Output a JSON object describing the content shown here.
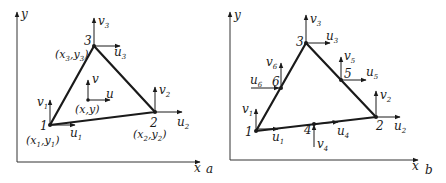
{
  "panels": [
    {
      "id": "a",
      "panel_label": "a",
      "axes": {
        "x": "x",
        "y": "y"
      },
      "nodes": [
        {
          "id": "1",
          "label": "1",
          "coord": "(x1,y1)",
          "u": "u1",
          "v": "v1"
        },
        {
          "id": "2",
          "label": "2",
          "coord": "(x2,y2)",
          "u": "u2",
          "v": "v2"
        },
        {
          "id": "3",
          "label": "3",
          "coord": "(x3,y3)",
          "u": "u3",
          "v": "v3"
        }
      ],
      "interior_point": {
        "coord": "(x,y)",
        "u": "u",
        "v": "v"
      }
    },
    {
      "id": "b",
      "panel_label": "b",
      "axes": {
        "x": "x",
        "y": "y"
      },
      "nodes": [
        {
          "id": "1",
          "label": "1",
          "u": "u1",
          "v": "v1"
        },
        {
          "id": "2",
          "label": "2",
          "u": "u2",
          "v": "v2"
        },
        {
          "id": "3",
          "label": "3",
          "u": "u3",
          "v": "v3"
        },
        {
          "id": "4",
          "label": "4",
          "u": "u4",
          "v": "v4"
        },
        {
          "id": "5",
          "label": "5",
          "u": "u5",
          "v": "v5"
        },
        {
          "id": "6",
          "label": "6",
          "u": "u6",
          "v": "v6"
        }
      ]
    }
  ],
  "labels": {
    "a": {
      "x": "x",
      "y": "y",
      "panel": "a",
      "n1": "1",
      "n2": "2",
      "n3": "3",
      "u": "u",
      "v": "v",
      "sub1": "1",
      "sub2": "2",
      "sub3": "3",
      "x1": "x",
      "y1": "y",
      "pxy": "(x,y)"
    },
    "b": {
      "x": "x",
      "y": "y",
      "panel": "b",
      "n1": "1",
      "n2": "2",
      "n3": "3",
      "n4": "4",
      "n5": "5",
      "n6": "6",
      "u": "u",
      "v": "v",
      "sub1": "1",
      "sub2": "2",
      "sub3": "3",
      "sub4": "4",
      "sub5": "5",
      "sub6": "6"
    }
  }
}
